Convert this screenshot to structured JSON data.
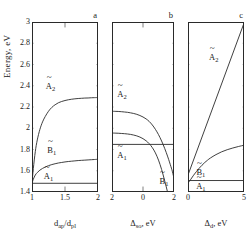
{
  "figure": {
    "ylabel": "Energy, eV",
    "ytick_labels": [
      "1.4",
      "1.6",
      "1.8",
      "2",
      "2.2",
      "2.4",
      "2.6",
      "2.8",
      "3"
    ],
    "ylim": [
      1.4,
      3.0
    ]
  },
  "chart_data": [
    {
      "type": "line",
      "panel": "a",
      "panel_letter": "a",
      "title": "",
      "xlabel": "d_ap/d_pl",
      "xlabel_base": "d",
      "xlabel_sub1": "ap",
      "xlabel_sub2": "pl",
      "ylabel": "Energy, eV",
      "xlim": [
        1,
        2
      ],
      "ylim": [
        1.4,
        3.0
      ],
      "xtick_labels": [
        "1",
        "1.5",
        "2"
      ],
      "xticks": [
        1,
        1.5,
        2
      ],
      "yticks": [
        1.4,
        1.6,
        1.8,
        2.0,
        2.2,
        2.4,
        2.6,
        2.8,
        3.0
      ],
      "grid": false,
      "legend": "inline-annotations",
      "series": [
        {
          "name": "A2tilde",
          "label": "A",
          "label_sub": "2",
          "x": [
            1.0,
            1.02,
            1.05,
            1.08,
            1.12,
            1.16,
            1.2,
            1.25,
            1.3,
            1.35,
            1.4,
            1.45,
            1.5,
            1.55,
            1.6,
            1.65,
            1.7,
            1.75,
            1.8,
            1.85,
            1.9,
            1.95,
            2.0
          ],
          "values": [
            1.48,
            1.62,
            1.78,
            1.89,
            1.99,
            2.06,
            2.11,
            2.16,
            2.196,
            2.221,
            2.24,
            2.252,
            2.261,
            2.268,
            2.273,
            2.277,
            2.28,
            2.282,
            2.284,
            2.285,
            2.287,
            2.288,
            2.289
          ]
        },
        {
          "name": "B1tilde",
          "label": "B",
          "label_sub": "1",
          "x": [
            1.0,
            1.02,
            1.05,
            1.08,
            1.12,
            1.16,
            1.2,
            1.25,
            1.3,
            1.35,
            1.4,
            1.45,
            1.5,
            1.55,
            1.6,
            1.65,
            1.7,
            1.75,
            1.8,
            1.85,
            1.9,
            1.95,
            2.0
          ],
          "values": [
            1.48,
            1.52,
            1.56,
            1.583,
            1.606,
            1.622,
            1.635,
            1.648,
            1.658,
            1.666,
            1.673,
            1.678,
            1.683,
            1.687,
            1.69,
            1.693,
            1.696,
            1.698,
            1.7,
            1.702,
            1.704,
            1.706,
            1.708
          ]
        },
        {
          "name": "A1tilde",
          "label": "A",
          "label_sub": "1",
          "x": [
            1.0,
            2.0
          ],
          "values": [
            1.482,
            1.482
          ]
        }
      ],
      "annotations": [
        {
          "text": "A2",
          "x": 1.28,
          "y": 2.4
        },
        {
          "text": "B1",
          "x": 1.3,
          "y": 1.8
        },
        {
          "text": "A1",
          "x": 1.25,
          "y": 1.555
        }
      ]
    },
    {
      "type": "line",
      "panel": "b",
      "panel_letter": "b",
      "title": "",
      "xlabel": "Δ_so, eV",
      "xlabel_base": "Δ",
      "xlabel_sub1": "so",
      "xlabel_unit": ", eV",
      "ylabel": "Energy, eV",
      "xlim": [
        -2,
        2
      ],
      "ylim": [
        1.4,
        3.0
      ],
      "xtick_labels": [
        "2",
        "0",
        "2"
      ],
      "xticks": [
        -2,
        0,
        2
      ],
      "yticks": [
        1.4,
        1.6,
        1.8,
        2.0,
        2.2,
        2.4,
        2.6,
        2.8,
        3.0
      ],
      "grid": false,
      "legend": "inline-annotations",
      "series": [
        {
          "name": "A2tilde",
          "label": "A",
          "label_sub": "2",
          "x": [
            -2.0,
            -1.8,
            -1.6,
            -1.4,
            -1.2,
            -1.0,
            -0.8,
            -0.6,
            -0.4,
            -0.2,
            0.0,
            0.2,
            0.4,
            0.6,
            0.8,
            1.0,
            1.2,
            1.4,
            1.6,
            1.8,
            1.9,
            2.0
          ],
          "values": [
            2.16,
            2.159,
            2.158,
            2.156,
            2.153,
            2.15,
            2.145,
            2.139,
            2.131,
            2.12,
            2.106,
            2.088,
            2.064,
            2.031,
            1.99,
            1.94,
            1.88,
            1.81,
            1.73,
            1.64,
            1.59,
            1.53
          ]
        },
        {
          "name": "B1tilde",
          "label": "B",
          "label_sub": "1",
          "x": [
            -2.0,
            -1.8,
            -1.6,
            -1.4,
            -1.2,
            -1.0,
            -0.8,
            -0.6,
            -0.4,
            -0.2,
            0.0,
            0.2,
            0.4,
            0.6,
            0.8,
            1.0,
            1.2,
            1.4,
            1.6,
            1.8,
            1.9,
            2.0
          ],
          "values": [
            1.955,
            1.954,
            1.953,
            1.951,
            1.949,
            1.946,
            1.942,
            1.936,
            1.928,
            1.917,
            1.902,
            1.882,
            1.855,
            1.818,
            1.768,
            1.7,
            1.612,
            1.505,
            1.39,
            1.272,
            1.215,
            1.16
          ]
        },
        {
          "name": "A1tilde",
          "label": "A",
          "label_sub": "1",
          "x": [
            -2.0,
            2.0
          ],
          "values": [
            1.848,
            1.848
          ]
        }
      ],
      "annotations": [
        {
          "text": "A2",
          "x": -1.35,
          "y": 2.32
        },
        {
          "text": "A1",
          "x": -1.35,
          "y": 1.745
        },
        {
          "text": "B1",
          "x": 1.35,
          "y": 1.505
        }
      ]
    },
    {
      "type": "line",
      "panel": "c",
      "panel_letter": "c",
      "title": "",
      "xlabel": "Δ_d, eV",
      "xlabel_base": "Δ",
      "xlabel_sub1": "d",
      "xlabel_unit": ", eV",
      "ylabel": "Energy, eV",
      "xlim": [
        0,
        5
      ],
      "ylim": [
        1.4,
        3.0
      ],
      "xtick_labels": [
        "0",
        "5"
      ],
      "xticks": [
        0,
        5
      ],
      "yticks": [
        1.4,
        1.6,
        1.8,
        2.0,
        2.2,
        2.4,
        2.6,
        2.8,
        3.0
      ],
      "grid": false,
      "legend": "inline-annotations",
      "series": [
        {
          "name": "A2tilde",
          "label": "A",
          "label_sub": "2",
          "x": [
            0.0,
            5.0
          ],
          "values": [
            1.56,
            2.99
          ]
        },
        {
          "name": "B1tilde",
          "label": "B",
          "label_sub": "1",
          "x": [
            0.0,
            0.25,
            0.5,
            0.75,
            1.0,
            1.25,
            1.5,
            1.75,
            2.0,
            2.5,
            3.0,
            3.5,
            4.0,
            4.5,
            5.0
          ],
          "values": [
            1.482,
            1.52,
            1.558,
            1.592,
            1.624,
            1.652,
            1.678,
            1.7,
            1.72,
            1.752,
            1.778,
            1.798,
            1.814,
            1.828,
            1.84
          ]
        },
        {
          "name": "A1tilde",
          "label": "A",
          "label_sub": "1",
          "x": [
            0.0,
            5.0
          ],
          "values": [
            1.508,
            1.508
          ]
        }
      ],
      "annotations": [
        {
          "text": "A2",
          "x": 2.3,
          "y": 2.67
        },
        {
          "text": "B1",
          "x": 1.15,
          "y": 1.585
        },
        {
          "text": "A1",
          "x": 1.15,
          "y": 1.455
        }
      ]
    }
  ]
}
